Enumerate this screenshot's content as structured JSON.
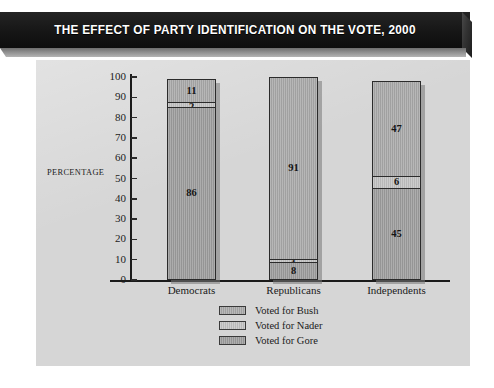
{
  "title": "THE EFFECT OF PARTY IDENTIFICATION ON THE VOTE, 2000",
  "axis": {
    "y_label": "PERCENTAGE",
    "y_ticks": [
      "0",
      "10",
      "20",
      "30",
      "40",
      "50",
      "60",
      "70",
      "80",
      "90",
      "100"
    ]
  },
  "legend": {
    "items": [
      {
        "label": "Voted for Bush",
        "color": "#a9a9a9"
      },
      {
        "label": "Voted for Nader",
        "color": "#c2c2c2"
      },
      {
        "label": "Voted for Gore",
        "color": "#9d9d9d"
      }
    ]
  },
  "bars": [
    {
      "category": "Democrats",
      "segments": [
        {
          "series": "Voted for Bush",
          "value": 11,
          "label": "11"
        },
        {
          "series": "Voted for Nader",
          "value": 2,
          "label": "2"
        },
        {
          "series": "Voted for Gore",
          "value": 86,
          "label": "86"
        }
      ]
    },
    {
      "category": "Republicans",
      "segments": [
        {
          "series": "Voted for Bush",
          "value": 91,
          "label": "91"
        },
        {
          "series": "Voted for Nader",
          "value": 1,
          "label": "1"
        },
        {
          "series": "Voted for Gore",
          "value": 8,
          "label": "8"
        }
      ]
    },
    {
      "category": "Independents",
      "segments": [
        {
          "series": "Voted for Bush",
          "value": 47,
          "label": "47"
        },
        {
          "series": "Voted for Nader",
          "value": 6,
          "label": "6"
        },
        {
          "series": "Voted for Gore",
          "value": 45,
          "label": "45"
        }
      ]
    }
  ],
  "chart_data": {
    "type": "bar",
    "subtype": "stacked-vertical",
    "title": "THE EFFECT OF PARTY IDENTIFICATION ON THE VOTE, 2000",
    "xlabel": "",
    "ylabel": "PERCENTAGE",
    "ylim": [
      0,
      100
    ],
    "ytick_step": 10,
    "grid": false,
    "legend_position": "bottom-center",
    "categories": [
      "Democrats",
      "Republicans",
      "Independents"
    ],
    "series": [
      {
        "name": "Voted for Bush",
        "values": [
          11,
          91,
          47
        ]
      },
      {
        "name": "Voted for Nader",
        "values": [
          2,
          1,
          6
        ]
      },
      {
        "name": "Voted for Gore",
        "values": [
          86,
          8,
          45
        ]
      }
    ],
    "stack_order_top_to_bottom": [
      "Voted for Bush",
      "Voted for Nader",
      "Voted for Gore"
    ],
    "totals": [
      99,
      100,
      98
    ],
    "data_labels": [
      {
        "category": "Democrats",
        "labels": [
          "11",
          "2",
          "86"
        ]
      },
      {
        "category": "Republicans",
        "labels": [
          "91",
          "1",
          "8"
        ]
      },
      {
        "category": "Independents",
        "labels": [
          "47",
          "6",
          "45"
        ]
      }
    ]
  }
}
